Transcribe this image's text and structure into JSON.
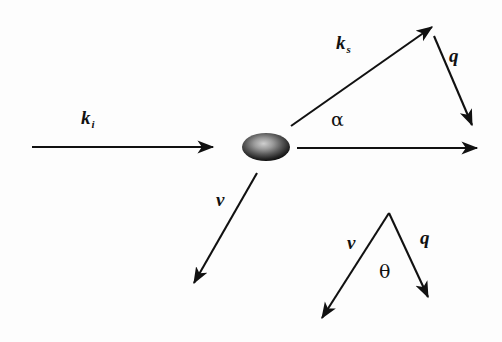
{
  "figure": {
    "background_color": "#fdfdfd",
    "stroke_color": "#111111"
  },
  "scatterer": {
    "name": "scattering-particle",
    "shape": "ellipse",
    "cx": 266,
    "cy": 147,
    "rx": 24,
    "ry": 14,
    "fill_dark": "#1a1a1a",
    "fill_light": "#b9b9b9"
  },
  "vectors": [
    {
      "id": "k-incident",
      "label": "k",
      "subscript": "i",
      "label_x": 81,
      "label_y": 108,
      "x1": 32,
      "y1": 147,
      "x2": 213,
      "y2": 147
    },
    {
      "id": "k-scattered",
      "label": "k",
      "subscript": "s",
      "label_x": 336,
      "label_y": 33,
      "x1": 291,
      "y1": 126,
      "x2": 432,
      "y2": 27
    },
    {
      "id": "q-upper",
      "label": "q",
      "subscript": "",
      "label_x": 449,
      "label_y": 46,
      "x1": 434,
      "y1": 36,
      "x2": 472,
      "y2": 125
    },
    {
      "id": "forward-beam",
      "label": "",
      "subscript": "",
      "label_x": 0,
      "label_y": 0,
      "x1": 297,
      "y1": 148,
      "x2": 477,
      "y2": 148
    },
    {
      "id": "v-velocity",
      "label": "v",
      "subscript": "",
      "label_x": 216,
      "label_y": 190,
      "x1": 257,
      "y1": 173,
      "x2": 194,
      "y2": 283
    },
    {
      "id": "v-triangle-left",
      "label": "v",
      "subscript": "",
      "label_x": 347,
      "label_y": 233,
      "x1": 389,
      "y1": 213,
      "x2": 322,
      "y2": 318
    },
    {
      "id": "q-triangle-right",
      "label": "q",
      "subscript": "",
      "label_x": 420,
      "label_y": 228,
      "x1": 389,
      "y1": 213,
      "x2": 428,
      "y2": 297
    }
  ],
  "angles": [
    {
      "id": "alpha-angle",
      "label": "α",
      "label_x": 331,
      "label_y": 110
    },
    {
      "id": "theta-angle",
      "label": "θ",
      "label_x": 379,
      "label_y": 262
    }
  ]
}
